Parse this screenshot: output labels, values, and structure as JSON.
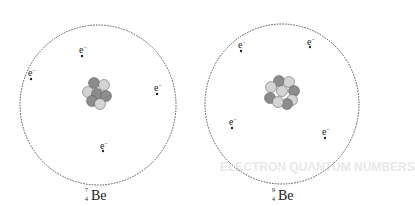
{
  "atoms": [
    {
      "name": "beryllium-7",
      "symbol": "Be",
      "mass_number": "7",
      "atomic_number": "4",
      "protons": 4,
      "neutrons": 3,
      "electrons": 4,
      "electron_label": "e⁻"
    },
    {
      "name": "beryllium-9",
      "symbol": "Be",
      "mass_number": "9",
      "atomic_number": "4",
      "protons": 4,
      "neutrons": 5,
      "electrons": 4,
      "electron_label": "e⁻"
    }
  ],
  "colors": {
    "proton": "#8c8c8c",
    "neutron": "#d4d4d4",
    "orbit": "#444444"
  },
  "background_ghost_text": "ELECTRON QUANTUM NUMBERS"
}
